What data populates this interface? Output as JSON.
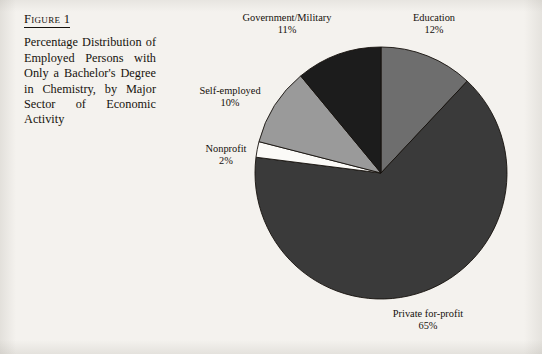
{
  "figure": {
    "heading": "Figure 1",
    "caption": "Percentage Distribution of Employed Persons with Only a Bachelor's Degree in Chemistry, by Major Sector of Economic Activity"
  },
  "labels": {
    "government": {
      "name": "Government/Military",
      "pct": "11%"
    },
    "education": {
      "name": "Education",
      "pct": "12%"
    },
    "selfemployed": {
      "name": "Self-employed",
      "pct": "10%"
    },
    "nonprofit": {
      "name": "Nonprofit",
      "pct": "2%"
    },
    "private": {
      "name": "Private for-profit",
      "pct": "65%"
    }
  },
  "chart_data": {
    "type": "pie",
    "title": "Percentage Distribution of Employed Persons with Only a Bachelor's Degree in Chemistry, by Major Sector of Economic Activity",
    "xlabel": "",
    "ylabel": "",
    "categories": [
      "Education",
      "Private for-profit",
      "Nonprofit",
      "Self-employed",
      "Government/Military"
    ],
    "values": [
      12,
      65,
      2,
      10,
      11
    ],
    "value_labels": [
      "12%",
      "65%",
      "2%",
      "10%",
      "11%"
    ],
    "unit": "percent",
    "total": 100,
    "start_angle_deg": 0,
    "direction": "clockwise",
    "colors": [
      "#6e6e6e",
      "#3a3a3a",
      "#fbfaf7",
      "#9a9a9a",
      "#1c1c1c"
    ],
    "slice_border_color": "#15110c",
    "legend": "none",
    "labels_position": "outside",
    "grid": false
  },
  "geometry": {
    "center_x": 221,
    "center_y": 173,
    "radius": 126
  }
}
